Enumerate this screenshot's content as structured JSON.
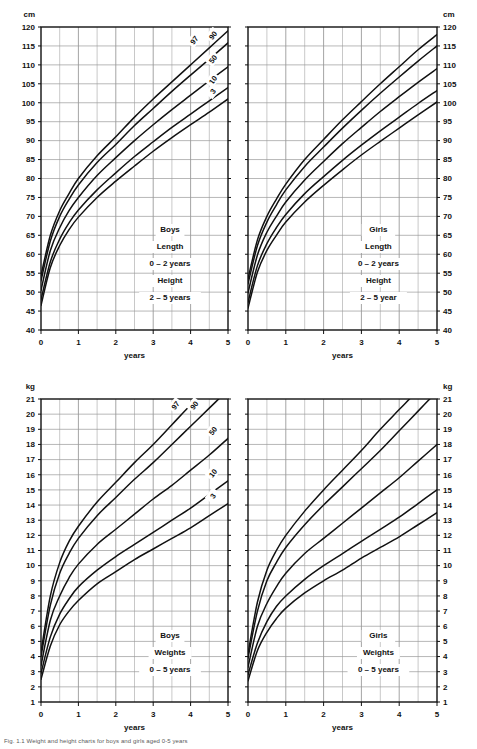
{
  "page": {
    "caption": "Fig. 1.1 Weight and height charts for boys and girls aged 0-5 years"
  },
  "charts": [
    {
      "id": "boys-length-height",
      "position": {
        "left": 0,
        "top": 0,
        "width": 240,
        "height": 372
      },
      "unit_label_left": "cm",
      "unit_label_right": "",
      "xlabel": "years",
      "annotation_lines": [
        "Boys",
        "Length",
        "0 – 2 years",
        "Height",
        "2 – 5 years"
      ],
      "yticks": [
        40,
        45,
        50,
        55,
        60,
        65,
        70,
        75,
        80,
        85,
        90,
        95,
        100,
        105,
        110,
        115,
        120
      ],
      "xticks": [
        0,
        1,
        2,
        3,
        4,
        5
      ],
      "show_left_labels": true,
      "show_right_labels": false,
      "show_percentile_labels": true,
      "chart_data": {
        "type": "line",
        "title": "Boys Length 0 – 2 years / Height 2 – 5 years",
        "xlabel": "years",
        "ylabel": "cm",
        "xlim": [
          0,
          5
        ],
        "ylim": [
          40,
          120
        ],
        "grid": true,
        "legend": "inline percentile curve labels at right end of each curve",
        "x": [
          0,
          0.25,
          0.5,
          0.75,
          1,
          1.5,
          2,
          2.5,
          3,
          3.5,
          4,
          4.5,
          5
        ],
        "series": [
          {
            "name": "97",
            "values": [
              54.4,
              65.0,
              71.5,
              76.0,
              80.0,
              86.0,
              91.0,
              96.2,
              101.0,
              105.5,
              110.0,
              114.5,
              119.0
            ]
          },
          {
            "name": "90",
            "values": [
              53.0,
              63.5,
              70.0,
              74.5,
              78.3,
              84.2,
              89.0,
              94.0,
              98.5,
              103.0,
              107.3,
              111.5,
              115.8
            ]
          },
          {
            "name": "50",
            "values": [
              50.5,
              61.0,
              67.0,
              71.5,
              75.0,
              80.8,
              85.5,
              90.0,
              94.2,
              98.2,
              102.0,
              105.8,
              109.5
            ]
          },
          {
            "name": "10",
            "values": [
              48.0,
              58.0,
              64.0,
              68.3,
              71.7,
              77.0,
              81.5,
              85.8,
              89.7,
              93.5,
              97.0,
              100.5,
              104.0
            ]
          },
          {
            "name": "3",
            "values": [
              46.5,
              56.5,
              62.3,
              66.5,
              69.8,
              75.0,
              79.3,
              83.3,
              87.2,
              90.8,
              94.2,
              97.5,
              101.0
            ]
          }
        ]
      }
    },
    {
      "id": "girls-length-height",
      "position": {
        "left": 240,
        "top": 0,
        "width": 237,
        "height": 372
      },
      "unit_label_left": "",
      "unit_label_right": "cm",
      "xlabel": "years",
      "annotation_lines": [
        "Girls",
        "Length",
        "0 – 2 years",
        "Height",
        "2 – 5 year"
      ],
      "yticks": [
        40,
        45,
        50,
        55,
        60,
        65,
        70,
        75,
        80,
        85,
        90,
        95,
        100,
        105,
        110,
        115,
        120
      ],
      "xticks": [
        0,
        1,
        2,
        3,
        4,
        5
      ],
      "show_left_labels": false,
      "show_right_labels": true,
      "show_percentile_labels": false,
      "chart_data": {
        "type": "line",
        "title": "Girls Length 0 – 2 years / Height 2 – 5 year",
        "xlabel": "years",
        "ylabel": "cm",
        "xlim": [
          0,
          5
        ],
        "ylim": [
          40,
          120
        ],
        "grid": true,
        "legend": "none",
        "x": [
          0,
          0.25,
          0.5,
          0.75,
          1,
          1.5,
          2,
          2.5,
          3,
          3.5,
          4,
          4.5,
          5
        ],
        "series": [
          {
            "name": "97",
            "values": [
              53.5,
              63.8,
              70.0,
              74.5,
              78.5,
              85.0,
              90.3,
              95.5,
              100.3,
              105.0,
              109.5,
              114.0,
              118.0
            ]
          },
          {
            "name": "90",
            "values": [
              52.2,
              62.3,
              68.5,
              73.0,
              77.0,
              83.2,
              88.3,
              93.3,
              98.0,
              102.5,
              106.8,
              111.0,
              115.0
            ]
          },
          {
            "name": "50",
            "values": [
              49.8,
              59.8,
              65.8,
              70.0,
              73.8,
              79.6,
              84.5,
              89.2,
              93.5,
              97.7,
              101.6,
              105.4,
              109.0
            ]
          },
          {
            "name": "10",
            "values": [
              47.3,
              57.0,
              62.8,
              67.0,
              70.5,
              76.0,
              80.5,
              84.8,
              88.8,
              92.6,
              96.2,
              99.8,
              103.2
            ]
          },
          {
            "name": "3",
            "values": [
              45.8,
              55.3,
              61.0,
              65.0,
              68.5,
              73.8,
              78.2,
              82.3,
              86.2,
              89.8,
              93.3,
              96.8,
              100.2
            ]
          }
        ]
      }
    },
    {
      "id": "boys-weights",
      "position": {
        "left": 0,
        "top": 372,
        "width": 240,
        "height": 372
      },
      "unit_label_left": "kg",
      "unit_label_right": "",
      "xlabel": "years",
      "annotation_lines": [
        "Boys",
        "Weights",
        "0 – 5 years"
      ],
      "yticks": [
        1,
        2,
        3,
        4,
        5,
        6,
        7,
        8,
        9,
        10,
        11,
        12,
        13,
        14,
        15,
        16,
        17,
        18,
        19,
        20,
        21
      ],
      "xticks": [
        0,
        1,
        2,
        3,
        4,
        5
      ],
      "show_left_labels": true,
      "show_right_labels": false,
      "show_percentile_labels": true,
      "chart_data": {
        "type": "line",
        "title": "Boys Weights 0 – 5 years",
        "xlabel": "years",
        "ylabel": "kg",
        "xlim": [
          0,
          5
        ],
        "ylim": [
          1,
          21
        ],
        "grid": true,
        "legend": "inline percentile curve labels at right end of each curve",
        "x": [
          0,
          0.25,
          0.5,
          0.75,
          1,
          1.5,
          2,
          2.5,
          3,
          3.5,
          4,
          4.5,
          5
        ],
        "series": [
          {
            "name": "97",
            "values": [
              4.3,
              8.0,
              10.2,
              11.6,
              12.6,
              14.2,
              15.5,
              16.8,
              18.0,
              19.3,
              20.6,
              21.8,
              23.0
            ]
          },
          {
            "name": "90",
            "values": [
              4.0,
              7.4,
              9.5,
              10.8,
              11.8,
              13.3,
              14.5,
              15.7,
              16.8,
              18.0,
              19.2,
              20.4,
              21.6
            ]
          },
          {
            "name": "50",
            "values": [
              3.4,
              6.4,
              8.0,
              9.2,
              10.1,
              11.4,
              12.4,
              13.4,
              14.4,
              15.3,
              16.3,
              17.3,
              18.4
            ]
          },
          {
            "name": "10",
            "values": [
              2.9,
              5.3,
              6.8,
              7.8,
              8.6,
              9.7,
              10.6,
              11.4,
              12.2,
              13.0,
              13.8,
              14.7,
              15.6
            ]
          },
          {
            "name": "3",
            "values": [
              2.5,
              4.7,
              6.1,
              7.0,
              7.7,
              8.8,
              9.6,
              10.4,
              11.1,
              11.8,
              12.5,
              13.3,
              14.1
            ]
          }
        ]
      }
    },
    {
      "id": "girls-weights",
      "position": {
        "left": 240,
        "top": 372,
        "width": 237,
        "height": 372
      },
      "unit_label_left": "",
      "unit_label_right": "kg",
      "xlabel": "years",
      "annotation_lines": [
        "Girls",
        "Weights",
        "0 – 5 years"
      ],
      "yticks": [
        1,
        2,
        3,
        4,
        5,
        6,
        7,
        8,
        9,
        10,
        11,
        12,
        13,
        14,
        15,
        16,
        17,
        18,
        19,
        20,
        21
      ],
      "xticks": [
        0,
        1,
        2,
        3,
        4,
        5
      ],
      "show_left_labels": false,
      "show_right_labels": true,
      "show_percentile_labels": false,
      "chart_data": {
        "type": "line",
        "title": "Girls Weights 0 – 5 years",
        "xlabel": "years",
        "ylabel": "kg",
        "xlim": [
          0,
          5
        ],
        "ylim": [
          1,
          21
        ],
        "grid": true,
        "legend": "none",
        "x": [
          0,
          0.25,
          0.5,
          0.75,
          1,
          1.5,
          2,
          2.5,
          3,
          3.5,
          4,
          4.5,
          5
        ],
        "series": [
          {
            "name": "97",
            "values": [
              4.2,
              7.6,
              9.7,
              11.0,
              12.0,
              13.6,
              15.0,
              16.3,
              17.6,
              19.0,
              20.3,
              21.6,
              23.0
            ]
          },
          {
            "name": "90",
            "values": [
              3.9,
              7.0,
              9.0,
              10.2,
              11.2,
              12.7,
              14.0,
              15.2,
              16.4,
              17.6,
              18.9,
              20.2,
              21.5
            ]
          },
          {
            "name": "50",
            "values": [
              3.3,
              6.0,
              7.5,
              8.6,
              9.5,
              10.8,
              11.8,
              12.8,
              13.8,
              14.8,
              15.8,
              16.9,
              18.0
            ]
          },
          {
            "name": "10",
            "values": [
              2.8,
              4.9,
              6.3,
              7.3,
              8.0,
              9.1,
              10.0,
              10.8,
              11.6,
              12.4,
              13.2,
              14.1,
              15.0
            ]
          },
          {
            "name": "3",
            "values": [
              2.4,
              4.4,
              5.6,
              6.5,
              7.2,
              8.2,
              9.0,
              9.7,
              10.5,
              11.2,
              11.9,
              12.7,
              13.5
            ]
          }
        ]
      }
    }
  ],
  "style": {
    "curve_color": "#111111",
    "grid_color": "#9a9a9a",
    "frame_color": "#111111",
    "background": "#ffffff"
  }
}
